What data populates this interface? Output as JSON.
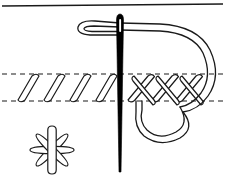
{
  "figure": {
    "description": "Needle and thread working a line of slanted stitches into crossed stitches between two dashed fabric guide lines, with a finished eight-petal star motif below",
    "canvas": {
      "width": 225,
      "height": 186,
      "background": "#ffffff"
    },
    "colors": {
      "ink": "#1a1a1a",
      "needle_fill": "#000000",
      "paper": "#ffffff",
      "thread_stroke": "#1a1a1a"
    },
    "stroke_widths": {
      "border": 1.4,
      "dashed_guide": 1.1,
      "thread": 1.3,
      "stitch_outline": 1.2
    }
  },
  "top_border": {
    "name": "page-rule",
    "x1": 2,
    "y1": 6,
    "x2": 223,
    "y2": 4,
    "visible": true
  },
  "fabric_guides": {
    "name": "fabric-guide-lines",
    "dash_pattern": "5,4",
    "upper_line_y": 74,
    "lower_line_y": 101,
    "x_start": 2,
    "x_end": 223
  },
  "needle": {
    "name": "sewing-needle",
    "x_center": 120,
    "tip_y": 172,
    "top_y": 14,
    "shaft_top_width": 7,
    "shaft_bottom_width": 1,
    "eye": {
      "y": 22,
      "height": 12,
      "width": 2
    },
    "filled": true
  },
  "thread": {
    "name": "working-thread",
    "segments": [
      {
        "id": "left-hairpin-loop",
        "description": "thread doubles back in a hairpin at upper left before entering the needle eye"
      },
      {
        "id": "through-eye",
        "description": "thread passes horizontally through the needle eye"
      },
      {
        "id": "right-large-arc",
        "description": "long thread arc sweeping right and down past the fabric edge"
      },
      {
        "id": "lower-return-loop",
        "description": "thread loops under the fabric line and returns up into the crossed stitches"
      }
    ],
    "double_line": true
  },
  "slanted_stitches": {
    "name": "slanted-stitch-group",
    "count": 4,
    "description": "elongated narrow loops slanting up to the right, spanning the fabric band",
    "x_positions": [
      18,
      44,
      70,
      96
    ],
    "top_y": 76,
    "bottom_y": 100,
    "slant_dx": 14,
    "loop_width": 7
  },
  "crossed_stitches": {
    "name": "crossed-stitch-group",
    "count": 3,
    "description": "stitches crossing each other to form X shapes at the right of the band",
    "x_positions": [
      143,
      167,
      191
    ],
    "top_y": 76,
    "bottom_y": 100,
    "arm_spread": 20,
    "stroke_width": 7
  },
  "star_motif": {
    "name": "eight-petal-star-motif",
    "center_x": 52,
    "center_y": 150,
    "petal_count": 8,
    "petal_length": 22,
    "petal_width": 8,
    "angles_deg": [
      0,
      45,
      90,
      135,
      180,
      225,
      270,
      315
    ],
    "description": "finished star / asterisk motif made of eight elongated petal loops"
  },
  "labels": {
    "caption": "",
    "figure_number": ""
  }
}
